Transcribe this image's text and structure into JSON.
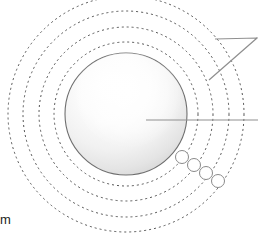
{
  "figure": {
    "background_color": "#ffffff",
    "caption_fragment": "m",
    "nucleus": {
      "name": "nucleus-sphere",
      "center_x": 126,
      "center_y": 114,
      "radius": 61,
      "stroke_color": "#6f6f6f",
      "fill_light": "#ffffff",
      "fill_shadow": "#dcdcdc",
      "highlight_x": 150,
      "highlight_y": 84
    },
    "shells": [
      {
        "label": "shell-1",
        "radius": 72,
        "stroke_color": "#555555",
        "dash": "2,3"
      },
      {
        "label": "shell-2",
        "radius": 87,
        "stroke_color": "#555555",
        "dash": "2,3"
      },
      {
        "label": "shell-3",
        "radius": 103,
        "stroke_color": "#555555",
        "dash": "2,3"
      },
      {
        "label": "shell-4",
        "radius": 118,
        "stroke_color": "#555555",
        "dash": "2,3"
      }
    ],
    "electrons": [
      {
        "label": "electron-1",
        "cx": 182,
        "cy": 157,
        "r": 6.5
      },
      {
        "label": "electron-2",
        "cx": 194,
        "cy": 165,
        "r": 6.5
      },
      {
        "label": "electron-3",
        "cx": 206,
        "cy": 173,
        "r": 6.5
      },
      {
        "label": "electron-4",
        "cx": 218,
        "cy": 181,
        "r": 6.5
      }
    ],
    "electron_stroke_color": "#8a8a8a",
    "electron_fill_color": "#ffffff",
    "leaders": [
      {
        "label": "leader-shells",
        "kind": "polyline",
        "points": "209,80 257,38 215,39",
        "stroke_color": "#8f8f8f"
      },
      {
        "label": "leader-nucleus",
        "kind": "line",
        "x1": 146,
        "y1": 120,
        "x2": 258,
        "y2": 120,
        "stroke_color": "#8f8f8f"
      }
    ]
  }
}
